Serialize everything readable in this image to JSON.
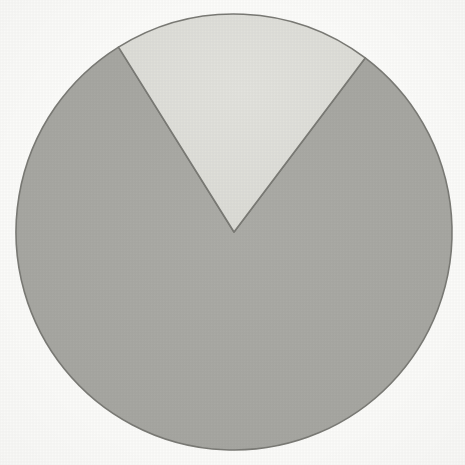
{
  "figure": {
    "title": "",
    "background_color": "#fcfcfa",
    "width": 465,
    "height": 465
  },
  "pie": {
    "center_x": 234,
    "center_y": 232,
    "radius": 218,
    "start_angle_deg": -32,
    "stroke_color": "#7a7a75",
    "stroke_width": 1.6,
    "slice_major_name": "major-slice",
    "slice_minor_name": "minor-slice"
  },
  "chart_data": {
    "type": "pie",
    "title": "",
    "subtitle": "",
    "xlabel": "",
    "ylabel": "",
    "legend": [],
    "legend_position": "none",
    "labels": [
      "Segment 1",
      "Segment 2"
    ],
    "values": [
      81,
      19
    ],
    "percentages": [
      "81%",
      "19%"
    ],
    "angles_deg": [
      291,
      69
    ],
    "colors": [
      "#a8a8a3",
      "#dedad5"
    ],
    "start_angle_deg": -32,
    "direction": "clockwise",
    "annotations": [],
    "data_labels_shown": false,
    "grid": false
  }
}
